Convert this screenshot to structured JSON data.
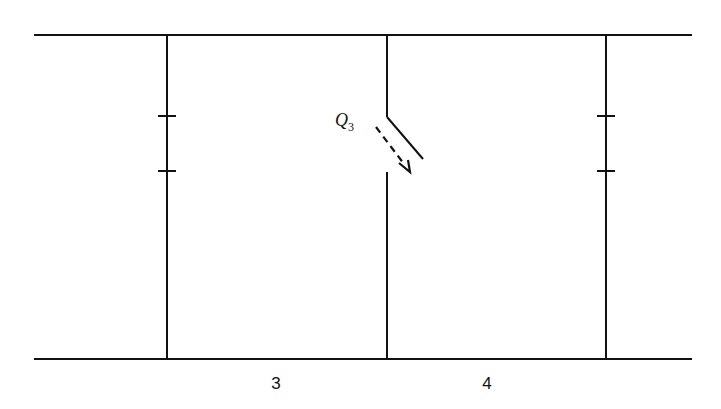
{
  "diagram": {
    "switch_label": "Q",
    "switch_label_subscript": "3",
    "region_labels": [
      "3",
      "4"
    ],
    "stroke_color": "#111111",
    "background": "#ffffff"
  }
}
